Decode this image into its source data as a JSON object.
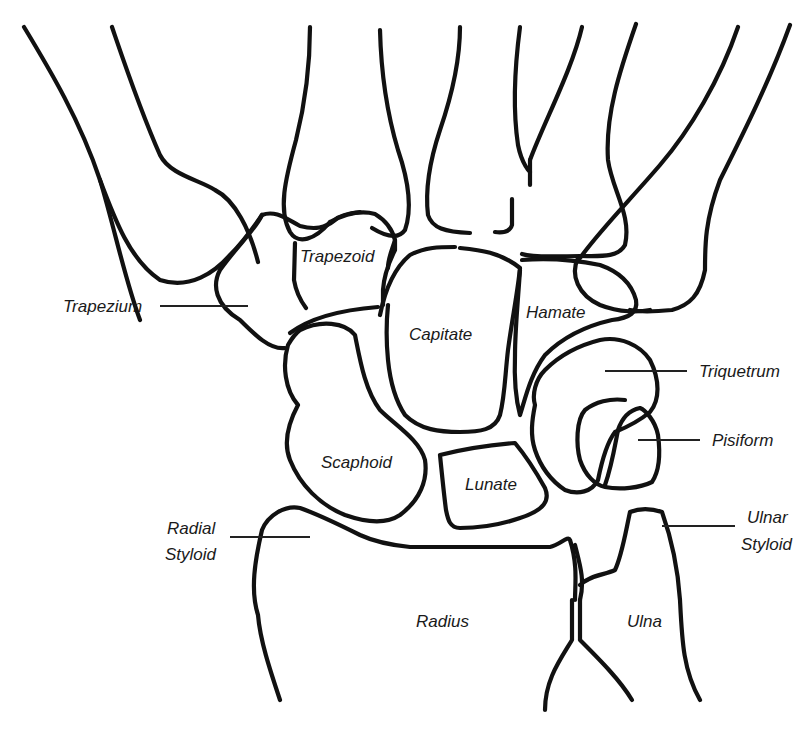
{
  "diagram": {
    "colors": {
      "line": "#111111",
      "background": "#ffffff",
      "label": "#1a1a1a"
    },
    "labels": {
      "trapezoid": "Trapezoid",
      "trapezium": "Trapezium",
      "capitate": "Capitate",
      "hamate": "Hamate",
      "triquetrum": "Triquetrum",
      "pisiform": "Pisiform",
      "scaphoid": "Scaphoid",
      "lunate": "Lunate",
      "radial_styloid_line1": "Radial",
      "radial_styloid_line2": "Styloid",
      "ulnar_styloid_line1": "Ulnar",
      "ulnar_styloid_line2": "Styloid",
      "radius": "Radius",
      "ulna": "Ulna"
    }
  }
}
